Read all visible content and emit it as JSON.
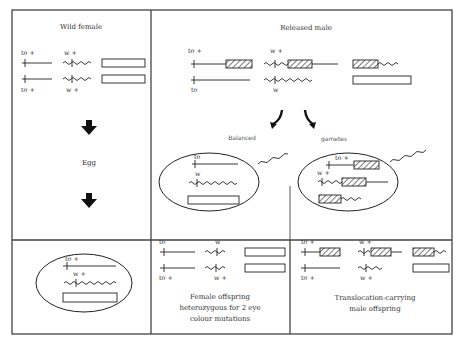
{
  "panels": {
    "wild_female": {
      "title": "Wild female",
      "top_labels": {
        "to": "to +",
        "w": "w +"
      },
      "bottom_labels": {
        "to": "to +",
        "w": "w +"
      }
    },
    "released_male": {
      "title": "Released male",
      "top_labels": {
        "to": "to +",
        "w": "w +"
      },
      "bottom_labels": {
        "to": "to",
        "w": "w"
      }
    },
    "egg_column": {
      "label": "Egg"
    },
    "balanced": {
      "title": "Balanced",
      "labels": {
        "to": "to",
        "w": "w"
      }
    },
    "gametes": {
      "title": "gametes",
      "labels": {
        "to": "to +",
        "w": "w +"
      }
    },
    "egg_cell": {
      "labels": {
        "to": "to +",
        "w": "w +"
      }
    },
    "female_offspring": {
      "top_labels": {
        "to": "to",
        "w": "w"
      },
      "bottom_labels": {
        "to": "to +",
        "w": "w +"
      },
      "caption_lines": [
        "Female offspring",
        "heterozygous for  2 eye",
        "colour mutations"
      ]
    },
    "male_offspring": {
      "top_labels": {
        "to": "to +",
        "w": "w +"
      },
      "bottom_labels": {
        "to": "to +",
        "w": "w +"
      },
      "caption_lines": [
        "Translocation-carrying",
        "male offspring"
      ]
    }
  },
  "icons": {
    "down_arrow": "down-arrow-icon",
    "curved_arrow": "curved-arrow-icon",
    "sperm": "sperm-icon"
  },
  "colors": {
    "line": "#222222",
    "frame": "#444444",
    "text": "#333333",
    "background": "#ffffff"
  }
}
